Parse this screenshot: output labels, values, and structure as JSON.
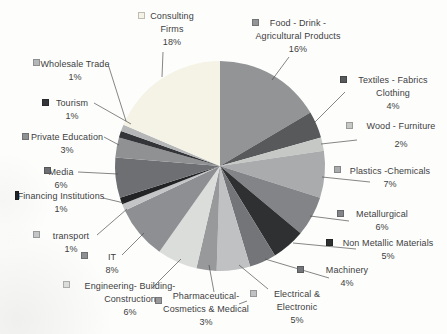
{
  "canvas": {
    "width": 447,
    "height": 334,
    "background": "#fdfdfc"
  },
  "pie": {
    "cx": 220,
    "cy": 166,
    "r": 105
  },
  "chart_data": {
    "type": "pie",
    "units": "%",
    "start_angle_deg": 0,
    "direction": "clockwise",
    "legend_position": "callout-labels-with-leader-lines",
    "categories": [
      "Food - Drink - Agricultural Products",
      "Textiles - Fabrics Clothing",
      "Wood - Furniture",
      "Plastics -Chemicals",
      "Metallurgical",
      "Non Metallic Materials",
      "Machinery",
      "Electrical & Electronic",
      "Pharmaceutical- Cosmetics & Medical",
      "Engineering- Building- Construction",
      "IT",
      "transport",
      "Financing Institutions",
      "Media",
      "Private Education",
      "Tourism",
      "Wholesale Trade",
      "Consulting Firms"
    ],
    "values": [
      16,
      4,
      2,
      7,
      6,
      5,
      4,
      5,
      3,
      6,
      8,
      1,
      1,
      6,
      3,
      1,
      1,
      18
    ],
    "slices": [
      {
        "id": "food-drink",
        "name": "Food - Drink - Agricultural Products",
        "value": 16,
        "pct": "16%",
        "color": "#929496",
        "label": {
          "lines": [
            "Food - Drink -",
            "Agricultural Products"
          ],
          "cx": 298,
          "top": 17
        },
        "marker": {
          "x": 252,
          "y": 19
        },
        "leaders": [
          [
            [
              289,
              57
            ],
            [
              272,
              80
            ]
          ]
        ]
      },
      {
        "id": "textiles",
        "name": "Textiles - Fabrics Clothing",
        "value": 4,
        "pct": "4%",
        "color": "#58595b",
        "label": {
          "lines": [
            "Textiles - Fabrics",
            "Clothing"
          ],
          "cx": 393,
          "top": 74
        },
        "marker": {
          "x": 340,
          "y": 76
        },
        "leaders": [
          [
            [
              345,
              92
            ],
            [
              314,
              123
            ]
          ]
        ]
      },
      {
        "id": "wood",
        "name": "Wood - Furniture",
        "value": 2,
        "pct": "2%",
        "color": "#c6c8c6",
        "label": {
          "lines": [
            "Wood - Furniture"
          ],
          "cx": 401,
          "top": 120,
          "pct_gap": true
        },
        "marker": {
          "x": 346,
          "y": 122
        },
        "leaders": [
          [
            [
              357,
              140
            ],
            [
              321,
              144
            ]
          ]
        ]
      },
      {
        "id": "plastics",
        "name": "Plastics -Chemicals",
        "value": 7,
        "pct": "7%",
        "color": "#a9abad",
        "label": {
          "lines": [
            "Plastics -Chemicals"
          ],
          "cx": 390,
          "top": 165
        },
        "marker": {
          "x": 334,
          "y": 166
        },
        "leaders": [
          [
            [
              370,
              182
            ],
            [
              322,
              177
            ]
          ]
        ]
      },
      {
        "id": "metallurgical",
        "name": "Metallurgical",
        "value": 6,
        "pct": "6%",
        "color": "#828487",
        "label": {
          "lines": [
            "Metallurgical"
          ],
          "cx": 382,
          "top": 208
        },
        "marker": {
          "x": 337,
          "y": 210
        },
        "leaders": [
          [
            [
              349,
              221
            ],
            [
              310,
              216
            ]
          ]
        ]
      },
      {
        "id": "non-metallic",
        "name": "Non Metallic Materials",
        "value": 5,
        "pct": "5%",
        "color": "#2e3032",
        "label": {
          "lines": [
            "Non Metallic Materials"
          ],
          "cx": 388,
          "top": 237
        },
        "marker": {
          "x": 326,
          "y": 239
        },
        "leaders": [
          [
            [
              356,
              249
            ],
            [
              293,
              243
            ]
          ]
        ]
      },
      {
        "id": "machinery",
        "name": "Machinery",
        "value": 4,
        "pct": "4%",
        "color": "#737578",
        "label": {
          "lines": [
            "Machinery"
          ],
          "cx": 347,
          "top": 264
        },
        "marker": {
          "x": 297,
          "y": 266
        },
        "leaders": [
          [
            [
              329,
              278
            ],
            [
              265,
              259
            ]
          ]
        ]
      },
      {
        "id": "electrical",
        "name": "Electrical & Electronic",
        "value": 5,
        "pct": "5%",
        "color": "#bfc1c3",
        "label": {
          "lines": [
            "Electrical &",
            "Electronic"
          ],
          "cx": 297,
          "top": 288
        },
        "marker": {
          "x": 250,
          "y": 290
        },
        "leaders": [
          [
            [
              268,
              289
            ],
            [
              239,
              265
            ]
          ]
        ]
      },
      {
        "id": "pharmaceutical",
        "name": "Pharmaceutical- Cosmetics & Medical",
        "value": 3,
        "pct": "3%",
        "color": "#97999b",
        "label": {
          "lines": [
            "Pharmaceutical-",
            "Cosmetics & Medical"
          ],
          "cx": 206,
          "top": 290
        },
        "marker": {
          "x": 155,
          "y": 297
        },
        "leaders": [
          [
            [
              214,
              292
            ],
            [
              209,
              265
            ]
          ],
          [
            [
              239,
              304
            ],
            [
              247,
              301
            ]
          ]
        ]
      },
      {
        "id": "engineering",
        "name": "Engineering- Building- Construction",
        "value": 6,
        "pct": "6%",
        "color": "#dbdddb",
        "label": {
          "lines": [
            "Engineering- Building-",
            "Construction"
          ],
          "cx": 130,
          "top": 280
        },
        "marker": {
          "x": 63,
          "y": 281
        },
        "leaders": [
          [
            [
              152,
              288
            ],
            [
              181,
              259
            ]
          ]
        ]
      },
      {
        "id": "it",
        "name": "IT",
        "value": 8,
        "pct": "8%",
        "color": "#8d8f92",
        "label": {
          "lines": [
            "IT"
          ],
          "cx": 112,
          "top": 251
        },
        "marker": {
          "x": 81,
          "y": 252
        },
        "leaders": [
          [
            [
              122,
              255
            ],
            [
              144,
              233
            ]
          ]
        ]
      },
      {
        "id": "transport",
        "name": "transport",
        "value": 1,
        "pct": "1%",
        "color": "#c3c5c7",
        "label": {
          "lines": [
            "transport"
          ],
          "cx": 71,
          "top": 230
        },
        "marker": {
          "x": 33,
          "y": 231
        },
        "leaders": [
          [
            [
              97,
              235
            ],
            [
              127,
              209
            ]
          ]
        ]
      },
      {
        "id": "financing",
        "name": "Financing Institutions",
        "value": 1,
        "pct": "1%",
        "color": "#212325",
        "label": {
          "lines": [
            "Financing Institutions"
          ],
          "cx": 61,
          "top": 190
        },
        "marker": {
          "x": 15,
          "y": 191,
          "w": 4,
          "h": 9
        },
        "leaders": [
          [
            [
              103,
              198
            ],
            [
              124,
              203
            ]
          ]
        ]
      },
      {
        "id": "media",
        "name": "Media",
        "value": 6,
        "pct": "6%",
        "color": "#6d6f72",
        "label": {
          "lines": [
            "Media"
          ],
          "cx": 61,
          "top": 166
        },
        "marker": {
          "x": 44,
          "y": 167
        },
        "leaders": [
          [
            [
              78,
              172
            ],
            [
              118,
              174
            ]
          ]
        ]
      },
      {
        "id": "private-education",
        "name": "Private Education",
        "value": 3,
        "pct": "3%",
        "color": "#8f9193",
        "label": {
          "lines": [
            "Private Education"
          ],
          "cx": 67,
          "top": 131
        },
        "marker": {
          "x": 22,
          "y": 133
        },
        "leaders": [
          [
            [
              104,
              137
            ],
            [
              119,
              145
            ]
          ]
        ]
      },
      {
        "id": "tourism",
        "name": "Tourism",
        "value": 1,
        "pct": "1%",
        "color": "#333538",
        "label": {
          "lines": [
            "Tourism"
          ],
          "cx": 72,
          "top": 97
        },
        "marker": {
          "x": 42,
          "y": 99
        },
        "leaders": [
          [
            [
              94,
              103
            ],
            [
              131,
              124
            ]
          ]
        ]
      },
      {
        "id": "wholesale",
        "name": "Wholesale Trade",
        "value": 1,
        "pct": "1%",
        "color": "#b4b6b8",
        "label": {
          "lines": [
            "Wholesale Trade"
          ],
          "cx": 75,
          "top": 58
        },
        "marker": {
          "x": 33,
          "y": 59
        },
        "leaders": [
          [
            [
              108,
              64
            ],
            [
              126,
              121
            ]
          ]
        ]
      },
      {
        "id": "consulting",
        "name": "Consulting Firms",
        "value": 18,
        "pct": "18%",
        "color": "#f5f3e6",
        "label": {
          "lines": [
            "Consulting",
            "Firms"
          ],
          "cx": 172,
          "top": 10
        },
        "marker": {
          "x": 138,
          "y": 12
        },
        "leaders": [
          [
            [
              163,
              52
            ],
            [
              162,
              77
            ]
          ]
        ]
      }
    ]
  }
}
